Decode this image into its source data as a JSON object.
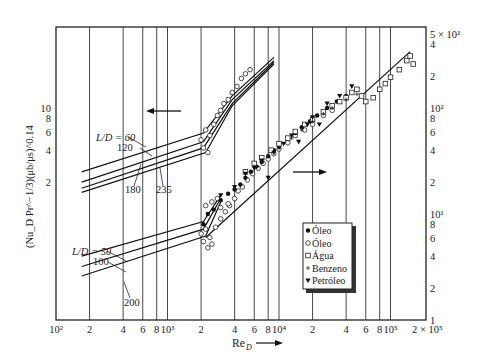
{
  "chart_data": {
    "type": "scatter",
    "title": "",
    "xlabel": "Re_D",
    "ylabel": "(Nu_D Pr^-1/3)(μb/μs)^0.14",
    "xscale": "log",
    "yscale": "log",
    "xlim": [
      100,
      200000
    ],
    "ylim_right": [
      1,
      500
    ],
    "ylim_left": [
      0.1,
      50
    ],
    "grid": "vertical",
    "x_ticks": [
      {
        "value": 100,
        "label": "10²"
      },
      {
        "value": 200,
        "label": "2"
      },
      {
        "value": 400,
        "label": "4"
      },
      {
        "value": 600,
        "label": "6"
      },
      {
        "value": 800,
        "label": "8"
      },
      {
        "value": 1000,
        "label": "10³"
      },
      {
        "value": 2000,
        "label": "2"
      },
      {
        "value": 4000,
        "label": "4"
      },
      {
        "value": 6000,
        "label": "6"
      },
      {
        "value": 8000,
        "label": "8"
      },
      {
        "value": 10000,
        "label": "10⁴"
      },
      {
        "value": 20000,
        "label": "2"
      },
      {
        "value": 40000,
        "label": "4"
      },
      {
        "value": 60000,
        "label": "6"
      },
      {
        "value": 80000,
        "label": "8"
      },
      {
        "value": 100000,
        "label": "10⁵"
      },
      {
        "value": 200000,
        "label": "2 × 10⁵"
      }
    ],
    "y_ticks_right": [
      {
        "value": 1,
        "label": "1"
      },
      {
        "value": 2,
        "label": "2"
      },
      {
        "value": 4,
        "label": "4"
      },
      {
        "value": 6,
        "label": "6"
      },
      {
        "value": 8,
        "label": "8"
      },
      {
        "value": 10,
        "label": "10¹"
      },
      {
        "value": 20,
        "label": "2"
      },
      {
        "value": 40,
        "label": "4"
      },
      {
        "value": 60,
        "label": "6"
      },
      {
        "value": 80,
        "label": "8"
      },
      {
        "value": 100,
        "label": "10²"
      },
      {
        "value": 200,
        "label": "2"
      },
      {
        "value": 400,
        "label": "4"
      },
      {
        "value": 500,
        "label": "5 × 10²"
      }
    ],
    "y_ticks_left": [
      {
        "value": 2,
        "label": "2"
      },
      {
        "value": 4,
        "label": "4"
      },
      {
        "value": 6,
        "label": "6"
      },
      {
        "value": 8,
        "label": "8"
      },
      {
        "value": 10,
        "label": "10"
      }
    ],
    "legend": [
      {
        "marker": "filled-circle",
        "label": "Óleo"
      },
      {
        "marker": "open-circle",
        "label": "Óleo"
      },
      {
        "marker": "open-square",
        "label": "Água"
      },
      {
        "marker": "plus",
        "label": "Benzeno"
      },
      {
        "marker": "filled-triangle-down",
        "label": "Petróleo"
      }
    ],
    "upper_group": {
      "axis": "left",
      "arrow": "left",
      "labels": [
        "L/D = 60",
        "120",
        "180",
        "235"
      ],
      "series": [
        {
          "name": "L/D = 60",
          "x": [
            170,
            2100,
            3800,
            9000
          ],
          "y": [
            2.5,
            5.8,
            13,
            30
          ]
        },
        {
          "name": "L/D = 120",
          "x": [
            170,
            2100,
            3800,
            9000
          ],
          "y": [
            2.0,
            4.8,
            12,
            28
          ]
        },
        {
          "name": "L/D = 180",
          "x": [
            170,
            2100,
            3800,
            9000
          ],
          "y": [
            1.75,
            4.2,
            11,
            27
          ]
        },
        {
          "name": "L/D = 235",
          "x": [
            170,
            2200,
            3800,
            9000
          ],
          "y": [
            1.6,
            3.8,
            10.5,
            26
          ]
        }
      ]
    },
    "lower_group": {
      "axis": "right",
      "arrow": "right",
      "labels": [
        "L/D = 50",
        "100",
        "200"
      ],
      "series": [
        {
          "name": "L/D = 50",
          "x": [
            170,
            2100,
            3000
          ],
          "y": [
            4.0,
            8.5,
            15
          ]
        },
        {
          "name": "L/D = 100",
          "x": [
            170,
            2100,
            3000
          ],
          "y": [
            3.2,
            7.2,
            14
          ]
        },
        {
          "name": "L/D = 200",
          "x": [
            170,
            2200,
            3000
          ],
          "y": [
            2.6,
            6.2,
            13
          ]
        }
      ],
      "turbulent_line": {
        "x": [
          2200,
          150000
        ],
        "y": [
          6.0,
          340
        ]
      }
    },
    "data_points": {
      "open-circle": [
        [
          2000,
          6.5
        ],
        [
          2100,
          5.5
        ],
        [
          2200,
          7.2
        ],
        [
          2300,
          4.8
        ],
        [
          2400,
          6.0
        ],
        [
          2500,
          5.2
        ],
        [
          2700,
          7.5
        ],
        [
          3000,
          9.0
        ],
        [
          3300,
          10.5
        ],
        [
          3600,
          12.0
        ],
        [
          4000,
          14.0
        ],
        [
          4300,
          16.5
        ],
        [
          4700,
          18.0
        ],
        [
          5200,
          21.0
        ],
        [
          5800,
          24.0
        ],
        [
          6500,
          27.0
        ],
        [
          7200,
          30.0
        ],
        [
          8000,
          33.0
        ],
        [
          9000,
          37.0
        ],
        [
          10000,
          41.0
        ],
        [
          12000,
          47.0
        ],
        [
          14000,
          55.0
        ],
        [
          17000,
          62.0
        ],
        [
          20000,
          70.0
        ],
        [
          25000,
          85.0
        ],
        [
          30000,
          95.0
        ],
        [
          2200,
          12
        ],
        [
          2500,
          13
        ],
        [
          2800,
          14
        ],
        [
          3000,
          11.5
        ],
        [
          3500,
          12.5
        ]
      ],
      "filled-circle": [
        [
          2100,
          8.0
        ],
        [
          2300,
          10.0
        ],
        [
          2600,
          11.0
        ],
        [
          3000,
          13.5
        ],
        [
          3500,
          15.5
        ],
        [
          4000,
          17.0
        ],
        [
          4500,
          19.0
        ],
        [
          5000,
          22.0
        ],
        [
          5600,
          25.0
        ],
        [
          6300,
          28.0
        ],
        [
          7000,
          31.0
        ],
        [
          8000,
          35.0
        ],
        [
          9000,
          40.0
        ],
        [
          10000,
          43.0
        ],
        [
          12000,
          52.0
        ],
        [
          14000,
          58.0
        ],
        [
          16000,
          66.0
        ],
        [
          19000,
          75.0
        ],
        [
          22000,
          85.0
        ],
        [
          27000,
          100.0
        ],
        [
          33000,
          115.0
        ],
        [
          40000,
          130.0
        ]
      ],
      "open-square": [
        [
          5000,
          25.0
        ],
        [
          6000,
          30.0
        ],
        [
          7000,
          34.0
        ],
        [
          8500,
          40.0
        ],
        [
          10000,
          46.0
        ],
        [
          12000,
          52.0
        ],
        [
          14000,
          60.0
        ],
        [
          17000,
          70.0
        ],
        [
          20000,
          78.0
        ],
        [
          25000,
          92.0
        ],
        [
          30000,
          105.0
        ],
        [
          35000,
          115.0
        ],
        [
          40000,
          125.0
        ],
        [
          45000,
          140.0
        ],
        [
          50000,
          150.0
        ],
        [
          55000,
          130.0
        ],
        [
          60000,
          115.0
        ],
        [
          70000,
          125.0
        ],
        [
          80000,
          150.0
        ],
        [
          90000,
          170.0
        ],
        [
          100000,
          195.0
        ],
        [
          120000,
          230.0
        ],
        [
          140000,
          280.0
        ],
        [
          150000,
          310.0
        ],
        [
          160000,
          260.0
        ]
      ],
      "plus": [
        [
          6000,
          28.0
        ],
        [
          8000,
          36.0
        ],
        [
          10000,
          42.0
        ],
        [
          13000,
          52.0
        ],
        [
          16000,
          62.0
        ],
        [
          20000,
          75.0
        ],
        [
          25000,
          88.0
        ],
        [
          30000,
          100.0
        ],
        [
          40000,
          120.0
        ],
        [
          50000,
          135.0
        ]
      ],
      "filled-triangle-down": [
        [
          3000,
          15.0
        ],
        [
          4000,
          18.0
        ],
        [
          5000,
          24.0
        ],
        [
          6000,
          27.0
        ],
        [
          7000,
          32.0
        ],
        [
          8000,
          22.0
        ],
        [
          9000,
          38.0
        ],
        [
          11000,
          46.0
        ],
        [
          13000,
          55.0
        ],
        [
          15000,
          48.0
        ],
        [
          18000,
          70.0
        ],
        [
          20000,
          82.0
        ],
        [
          23000,
          70.0
        ],
        [
          27000,
          110.0
        ],
        [
          35000,
          130.0
        ],
        [
          45000,
          160.0
        ]
      ]
    }
  }
}
